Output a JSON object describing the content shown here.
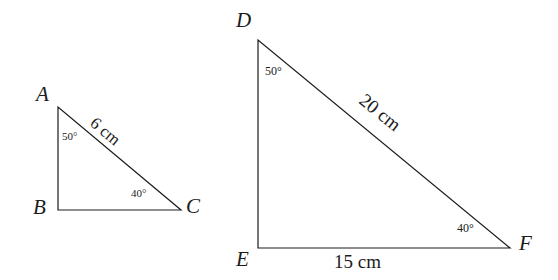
{
  "figure": {
    "background_color": "#ffffff",
    "stroke_color": "#1c1c1c",
    "stroke_width": 1.2,
    "width": 558,
    "height": 280
  },
  "triangles": [
    {
      "id": "ABC",
      "name": "triangle-abc",
      "vertices": [
        {
          "label": "A",
          "x": 58,
          "y": 107
        },
        {
          "label": "B",
          "x": 58,
          "y": 210
        },
        {
          "label": "C",
          "x": 181,
          "y": 210
        }
      ],
      "vertex_labels": [
        {
          "text": "A",
          "left": 36,
          "top": 84,
          "name": "vertex-label-a"
        },
        {
          "text": "B",
          "left": 33,
          "top": 197,
          "name": "vertex-label-b"
        },
        {
          "text": "C",
          "left": 186,
          "top": 196,
          "name": "vertex-label-c"
        }
      ],
      "angles": [
        {
          "text": "50°",
          "at": "A",
          "left": 62,
          "top": 131,
          "name": "angle-a-50"
        },
        {
          "text": "40°",
          "at": "C",
          "left": 131,
          "top": 188,
          "name": "angle-c-40"
        }
      ],
      "sides": [
        {
          "text": "6 cm",
          "on": "AC",
          "left": 98,
          "top": 114,
          "rotation": 40,
          "name": "side-ac-length"
        }
      ]
    },
    {
      "id": "DEF",
      "name": "triangle-def",
      "vertices": [
        {
          "label": "D",
          "x": 258,
          "y": 40
        },
        {
          "label": "E",
          "x": 258,
          "y": 248
        },
        {
          "label": "F",
          "x": 510,
          "y": 248
        }
      ],
      "vertex_labels": [
        {
          "text": "D",
          "left": 236,
          "top": 10,
          "name": "vertex-label-d"
        },
        {
          "text": "E",
          "left": 236,
          "top": 249,
          "name": "vertex-label-e"
        },
        {
          "text": "F",
          "left": 519,
          "top": 233,
          "name": "vertex-label-f"
        }
      ],
      "angles": [
        {
          "text": "50°",
          "at": "D",
          "left": 265,
          "top": 65,
          "name": "angle-d-50"
        },
        {
          "text": "40°",
          "at": "F",
          "left": 457,
          "top": 222,
          "name": "angle-f-40"
        }
      ],
      "sides": [
        {
          "text": "20 cm",
          "on": "DF",
          "left": 368,
          "top": 90,
          "rotation": 39,
          "name": "side-df-length"
        },
        {
          "text": "15 cm",
          "on": "EF",
          "left": 334,
          "top": 252,
          "rotation": 0,
          "name": "side-ef-length"
        }
      ]
    }
  ]
}
